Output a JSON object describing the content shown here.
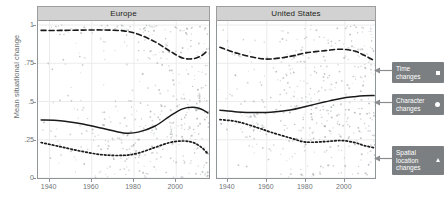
{
  "chart_data": {
    "type": "line",
    "title": "",
    "xlabel": "",
    "ylabel": "Mean situational change",
    "xlim": [
      1935,
      2016
    ],
    "ylim": [
      0,
      1.02
    ],
    "grid": true,
    "legend_position": "right-callouts",
    "facets": [
      "Europe",
      "United States"
    ],
    "x_ticks": [
      1940,
      1960,
      1980,
      2000
    ],
    "x_tick_labels": [
      "1940",
      "1960",
      "1980",
      "2000"
    ],
    "y_ticks": [
      0,
      0.25,
      0.5,
      0.75,
      1
    ],
    "y_tick_labels": [
      "0",
      ".25",
      ".5",
      ".75",
      "1"
    ],
    "panels": [
      {
        "name": "Europe",
        "series": [
          {
            "name": "Time changes",
            "style": "dashed",
            "marker": "square",
            "x": [
              1936,
              1945,
              1955,
              1965,
              1975,
              1982,
              1990,
              1997,
              2003,
              2008,
              2012,
              2015
            ],
            "values": [
              0.965,
              0.965,
              0.967,
              0.968,
              0.962,
              0.94,
              0.89,
              0.83,
              0.785,
              0.78,
              0.8,
              0.835
            ]
          },
          {
            "name": "Character changes",
            "style": "solid",
            "marker": "circle",
            "x": [
              1936,
              1945,
              1955,
              1965,
              1975,
              1982,
              1990,
              1997,
              2003,
              2008,
              2012,
              2015
            ],
            "values": [
              0.38,
              0.375,
              0.355,
              0.325,
              0.295,
              0.3,
              0.34,
              0.405,
              0.452,
              0.462,
              0.45,
              0.425
            ]
          },
          {
            "name": "Spatial location changes",
            "style": "dotted",
            "marker": "triangle",
            "x": [
              1936,
              1945,
              1955,
              1965,
              1975,
              1982,
              1990,
              1997,
              2003,
              2008,
              2012,
              2015
            ],
            "values": [
              0.232,
              0.205,
              0.175,
              0.152,
              0.148,
              0.163,
              0.2,
              0.232,
              0.242,
              0.232,
              0.2,
              0.158
            ]
          }
        ]
      },
      {
        "name": "United States",
        "series": [
          {
            "name": "Time changes",
            "style": "dashed",
            "marker": "square",
            "x": [
              1936,
              1945,
              1955,
              1962,
              1972,
              1980,
              1990,
              1998,
              2005,
              2010,
              2015
            ],
            "values": [
              0.855,
              0.815,
              0.785,
              0.778,
              0.795,
              0.818,
              0.833,
              0.842,
              0.83,
              0.802,
              0.768
            ]
          },
          {
            "name": "Character changes",
            "style": "solid",
            "marker": "circle",
            "x": [
              1936,
              1945,
              1955,
              1962,
              1972,
              1980,
              1990,
              1998,
              2005,
              2010,
              2015
            ],
            "values": [
              0.443,
              0.432,
              0.428,
              0.43,
              0.445,
              0.468,
              0.498,
              0.52,
              0.532,
              0.538,
              0.54
            ]
          },
          {
            "name": "Spatial location changes",
            "style": "dotted",
            "marker": "triangle",
            "x": [
              1936,
              1945,
              1955,
              1962,
              1972,
              1980,
              1990,
              1998,
              2005,
              2010,
              2015
            ],
            "values": [
              0.382,
              0.368,
              0.33,
              0.3,
              0.262,
              0.235,
              0.238,
              0.245,
              0.232,
              0.212,
              0.198
            ]
          }
        ]
      }
    ],
    "annotations": [
      {
        "id": "time",
        "label_line1": "Time",
        "label_line2": "changes",
        "marker": "square"
      },
      {
        "id": "character",
        "label_line1": "Character",
        "label_line2": "changes",
        "marker": "circle"
      },
      {
        "id": "spatial",
        "label_line1": "Spatial",
        "label_line2": "location",
        "label_line3": "changes",
        "marker": "triangle"
      }
    ],
    "colors": {
      "line": "#1a1a1a",
      "point": "#9aa0a4",
      "grid": "#ececec",
      "panel_strip": "#d2d2d2",
      "panel_border": "#8f9497",
      "callout_bg": "#7b7f82",
      "callout_text": "#ffffff",
      "axis_text": "#6e7376"
    }
  },
  "axis": {
    "y_title": "Mean situational change"
  },
  "facet_labels": {
    "left": "Europe",
    "right": "United States"
  }
}
